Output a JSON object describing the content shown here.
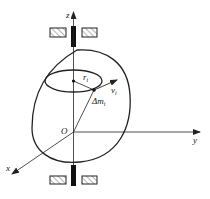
{
  "diagram": {
    "type": "rigid body rotating about fixed z-axis",
    "axes": {
      "z": "z",
      "y": "y",
      "x": "x",
      "origin": "O"
    },
    "labels": {
      "radius": "r",
      "radius_sub": "i",
      "velocity": "v",
      "velocity_sub": "i",
      "mass": "Δm",
      "mass_sub": "i"
    },
    "colors": {
      "stroke": "#222222",
      "hatch": "#555555",
      "background": "#ffffff"
    }
  }
}
